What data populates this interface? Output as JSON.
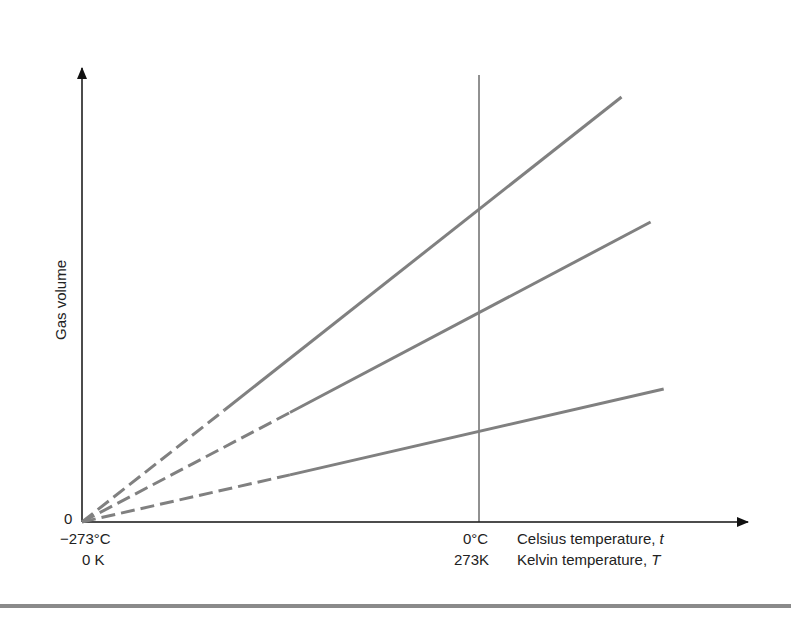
{
  "chart_data": {
    "type": "line",
    "title": "",
    "xlabel_celsius": "Celsius temperature, t",
    "xlabel_kelvin": "Kelvin temperature, T",
    "ylabel": "Gas volume",
    "x_ticks": [
      {
        "celsius": "−273°C",
        "kelvin": "0 K",
        "value_c": -273
      },
      {
        "celsius": "0°C",
        "kelvin": "273K",
        "value_c": 0
      }
    ],
    "y_ticks": [
      {
        "label": "0",
        "value": 0
      }
    ],
    "x_range_celsius": [
      -273,
      127
    ],
    "y_units": "arbitrary",
    "series": [
      {
        "name": "gas sample 1",
        "x": [
          -273,
          0,
          98
        ],
        "y": [
          0,
          312,
          425
        ],
        "extrapolated_dashed_until": -175
      },
      {
        "name": "gas sample 2",
        "x": [
          -273,
          0,
          118
        ],
        "y": [
          0,
          209,
          300
        ],
        "extrapolated_dashed_until": -130
      },
      {
        "name": "gas sample 3",
        "x": [
          -273,
          0,
          127
        ],
        "y": [
          0,
          90,
          133
        ],
        "extrapolated_dashed_until": -130
      }
    ],
    "reference_line": {
      "x_celsius": 0,
      "style": "vertical thin"
    },
    "grid": false,
    "legend": "none"
  },
  "labels": {
    "y_axis": "Gas volume",
    "origin_zero": "0",
    "tick_minus273c": "−273°C",
    "tick_0k": "0 K",
    "tick_0c": "0°C",
    "tick_273k": "273K",
    "celsius_axis_prefix": "Celsius temperature, ",
    "celsius_var": "t",
    "kelvin_axis_prefix": "Kelvin temperature, ",
    "kelvin_var": "T"
  },
  "colors": {
    "axis": "#111111",
    "series_line": "#7f7f7f",
    "divider": "#8a8a8a"
  }
}
